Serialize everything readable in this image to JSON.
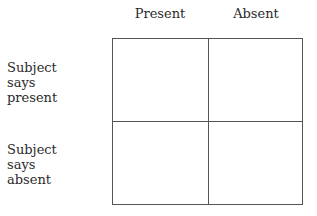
{
  "columns": {
    "present": "Present",
    "absent": "Absent"
  },
  "rows": {
    "present": "Subject\nsays\npresent",
    "absent": "Subject\nsays\nabsent"
  },
  "cells": [
    {
      "row": "present",
      "col": "present",
      "value": ""
    },
    {
      "row": "present",
      "col": "absent",
      "value": ""
    },
    {
      "row": "absent",
      "col": "present",
      "value": ""
    },
    {
      "row": "absent",
      "col": "absent",
      "value": ""
    }
  ]
}
